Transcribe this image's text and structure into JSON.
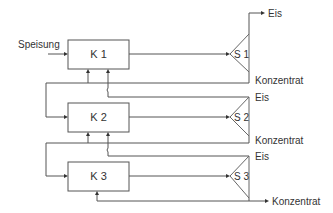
{
  "diagram": {
    "feed_label": "Speisung",
    "crystallizers": [
      {
        "id": "k1",
        "label": "K 1"
      },
      {
        "id": "k2",
        "label": "K 2"
      },
      {
        "id": "k3",
        "label": "K 3"
      }
    ],
    "separators": [
      {
        "id": "s1",
        "label": "S 1"
      },
      {
        "id": "s2",
        "label": "S 2"
      },
      {
        "id": "s3",
        "label": "S 3"
      }
    ],
    "outputs": {
      "s1_top": "Eis",
      "s1_bottom": "Konzentrat",
      "s2_top": "Eis",
      "s2_bottom": "Konzentrat",
      "s3_top": "Eis",
      "s3_bottom": "Konzentrat"
    }
  }
}
